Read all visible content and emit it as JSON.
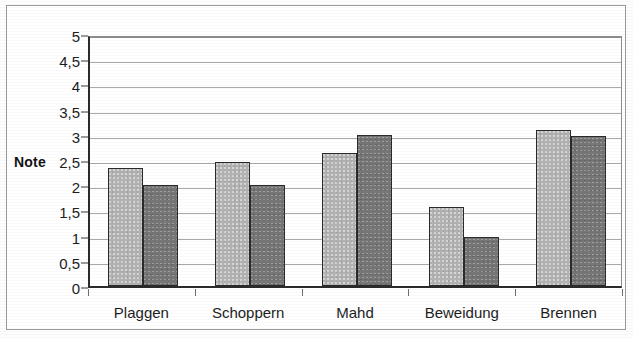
{
  "chart_data": {
    "type": "bar",
    "title": "",
    "subtitle": "",
    "xlabel": "",
    "ylabel": "Note",
    "categories": [
      "Plaggen",
      "Schoppern",
      "Mahd",
      "Beweidung",
      "Brennen"
    ],
    "series": [
      {
        "name": "series-1",
        "color": "#b2b2b2",
        "values": [
          2.35,
          2.47,
          2.63,
          1.57,
          3.1
        ]
      },
      {
        "name": "series-2",
        "color": "#767676",
        "values": [
          2.0,
          2.0,
          3.0,
          0.97,
          2.98
        ]
      }
    ],
    "ylim": [
      0,
      5
    ],
    "ytick_values": [
      0,
      0.5,
      1,
      1.5,
      2,
      2.5,
      3,
      3.5,
      4,
      4.5,
      5
    ],
    "ytick_labels": [
      "0",
      "0,5",
      "1",
      "1,5",
      "2",
      "2,5",
      "3",
      "3,5",
      "4",
      "4,5",
      "5"
    ],
    "grid": true,
    "grid_axis": "y",
    "legend": false,
    "legend_position": "none",
    "decimal_separator": ",",
    "colors": {
      "axis": "#2b2b2b",
      "gridline": "#a9a9a9",
      "text": "#1d1d1d",
      "frame": "#9a9a9a",
      "background": "#ffffff",
      "bar_outline": "#2a2a2a"
    }
  }
}
